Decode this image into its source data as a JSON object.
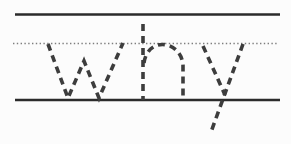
{
  "worksheet": {
    "word": "why",
    "kind": "handwriting-tracing-practice"
  },
  "canvas": {
    "width": 291,
    "height": 144,
    "background": "#fcfcfc"
  },
  "colors": {
    "solid_line": "#2b2b2b",
    "dotted_line": "#7e7e7e",
    "letter_stroke": "#3d3d3d"
  },
  "stroke": {
    "width": 3.6,
    "dash": "7 5",
    "linecap": "butt"
  },
  "guides": [
    {
      "name": "top-guide-line",
      "style": "solid",
      "y": 14.5,
      "x1": 15,
      "x2": 280,
      "width": 2.6
    },
    {
      "name": "middle-dotted-line",
      "style": "dotted",
      "y": 43.5,
      "x1": 13,
      "x2": 279,
      "width": 1.6,
      "dash": "1.4 2.4"
    },
    {
      "name": "base-guide-line",
      "style": "solid",
      "y": 100,
      "x1": 15,
      "x2": 280,
      "width": 2.6
    }
  ],
  "letters": [
    {
      "name": "traced-letter-w",
      "paths": [
        "M48 44 L68 98 L84 61 L99 98 L123 43"
      ]
    },
    {
      "name": "traced-letter-h",
      "paths": [
        "M143 24 L143 100",
        "M144 63 C145.5 51 153.5 44.5 162.5 44.5 C172 44.5 182 52 183 65 L183 99"
      ]
    },
    {
      "name": "traced-letter-y",
      "paths": [
        "M203 46 L225 95",
        "M243 44 L211 132"
      ]
    }
  ]
}
